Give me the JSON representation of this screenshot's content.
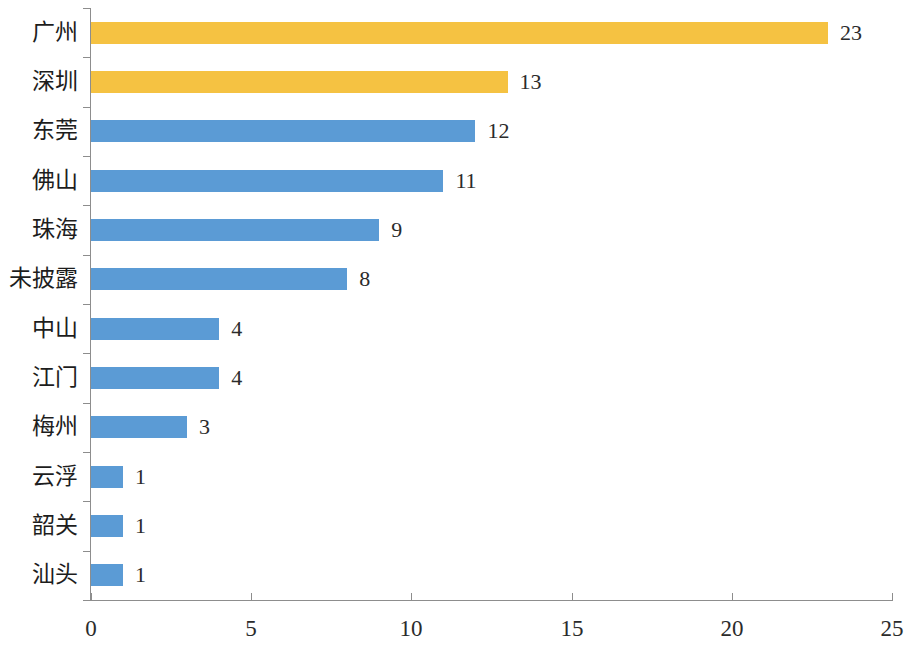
{
  "chart_data": {
    "type": "bar",
    "orientation": "horizontal",
    "title": "",
    "subtitle": "",
    "xlabel": "",
    "ylabel": "",
    "xlim": [
      0,
      25
    ],
    "xticks": [
      "0",
      "5",
      "10",
      "15",
      "20",
      "25"
    ],
    "grid": false,
    "legend": null,
    "categories": [
      "广州",
      "深圳",
      "东莞",
      "佛山",
      "珠海",
      "未披露",
      "中山",
      "江门",
      "梅州",
      "云浮",
      "韶关",
      "汕头"
    ],
    "values": [
      23,
      13,
      12,
      11,
      9,
      8,
      4,
      4,
      3,
      1,
      1,
      1
    ],
    "value_labels": [
      "23",
      "13",
      "12",
      "11",
      "9",
      "8",
      "4",
      "4",
      "3",
      "1",
      "1",
      "1"
    ],
    "bar_colors": [
      "#f5c242",
      "#f5c242",
      "#5b9bd5",
      "#5b9bd5",
      "#5b9bd5",
      "#5b9bd5",
      "#5b9bd5",
      "#5b9bd5",
      "#5b9bd5",
      "#5b9bd5",
      "#5b9bd5",
      "#5b9bd5"
    ],
    "highlight_color": "#f5c242",
    "base_color": "#5b9bd5",
    "axis_color": "#8d8d8d",
    "background_color": "#ffffff"
  }
}
